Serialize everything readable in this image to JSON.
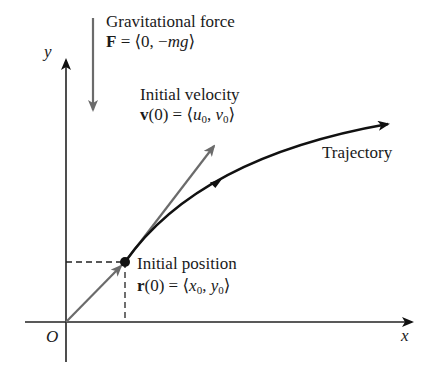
{
  "diagram": {
    "type": "projectile-motion-vector-diagram",
    "axes": {
      "x_label": "x",
      "y_label": "y",
      "origin_label": "O"
    },
    "gravity": {
      "title": "Gravitational force",
      "eq_lhs": "F",
      "eq_rhs": " = ⟨0, −",
      "eq_var": "mg",
      "eq_close": "⟩",
      "arrow_color": "#6b6b6b"
    },
    "velocity": {
      "title": "Initial velocity",
      "eq_lhs": "v",
      "eq_mid": "(0) = ⟨",
      "u": "u",
      "u_sub": "0",
      "sep": ", ",
      "v": "v",
      "v_sub": "0",
      "eq_close": "⟩",
      "arrow_color": "#6b6b6b"
    },
    "trajectory": {
      "label": "Trajectory",
      "color": "#111111"
    },
    "position": {
      "title": "Initial position",
      "eq_lhs": "r",
      "eq_mid": "(0) = ⟨",
      "x": "x",
      "x_sub": "0",
      "sep": ", ",
      "y": "y",
      "y_sub": "0",
      "eq_close": "⟩",
      "vector_color": "#6b6b6b"
    }
  }
}
